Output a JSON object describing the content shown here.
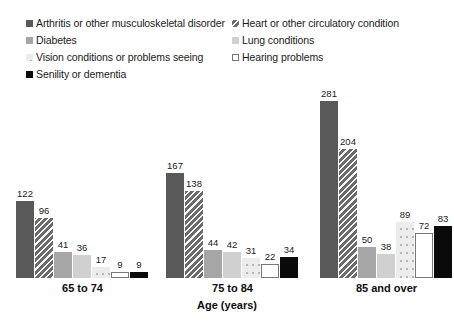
{
  "legend": {
    "left_column": [
      {
        "label": "Arthritis or other musculoskeletal disorder",
        "style": "s-darkgray",
        "icon": "legend-swatch-arthritis"
      },
      {
        "label": "Diabetes",
        "style": "s-medgray",
        "icon": "legend-swatch-diabetes"
      },
      {
        "label": "Vision conditions or problems seeing",
        "style": "s-dotted",
        "icon": "legend-swatch-vision"
      },
      {
        "label": "Senility or dementia",
        "style": "s-black",
        "icon": "legend-swatch-senility"
      }
    ],
    "right_column": [
      {
        "label": "Heart or other circulatory condition",
        "style": "s-hatch",
        "icon": "legend-swatch-heart"
      },
      {
        "label": "Lung conditions",
        "style": "s-lightgray",
        "icon": "legend-swatch-lung"
      },
      {
        "label": "Hearing problems",
        "style": "s-white",
        "icon": "legend-swatch-hearing"
      }
    ]
  },
  "axis": {
    "title": "Age (years)",
    "groups": [
      "65 to 74",
      "75 to 84",
      "85 and over"
    ]
  },
  "chart_data": {
    "type": "bar",
    "title": "",
    "xlabel": "Age (years)",
    "ylabel": "",
    "categories": [
      "65 to 74",
      "75 to 84",
      "85 and over"
    ],
    "ylim": [
      0,
      300
    ],
    "grid": false,
    "legend_position": "top",
    "series": [
      {
        "name": "Arthritis or other musculoskeletal disorder",
        "style": "s-darkgray",
        "values": [
          122,
          167,
          281
        ]
      },
      {
        "name": "Heart or other circulatory condition",
        "style": "s-hatch",
        "values": [
          96,
          138,
          204
        ]
      },
      {
        "name": "Diabetes",
        "style": "s-medgray",
        "values": [
          41,
          44,
          50
        ]
      },
      {
        "name": "Lung conditions",
        "style": "s-lightgray",
        "values": [
          36,
          42,
          38
        ]
      },
      {
        "name": "Vision conditions or problems seeing",
        "style": "s-dotted",
        "values": [
          17,
          31,
          89
        ]
      },
      {
        "name": "Hearing problems",
        "style": "s-white",
        "values": [
          9,
          22,
          72
        ]
      },
      {
        "name": "Senility or dementia",
        "style": "s-black",
        "values": [
          9,
          34,
          83
        ]
      }
    ]
  },
  "layout": {
    "group_left": [
      16,
      166,
      320
    ],
    "bar_pitch": 19,
    "bar_width": 18,
    "plot_height": 196,
    "value_scale": 0.63
  }
}
